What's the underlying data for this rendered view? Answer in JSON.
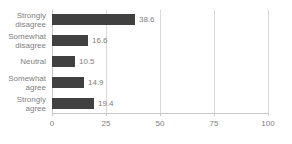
{
  "chart_data": {
    "type": "bar",
    "orientation": "horizontal",
    "title": "",
    "xlabel": "",
    "ylabel": "",
    "xlim": [
      0,
      100
    ],
    "xticks": [
      0,
      25,
      50,
      75,
      100
    ],
    "xtick_labels": [
      "0",
      "25",
      "50",
      "75",
      "100"
    ],
    "grid": true,
    "legend": false,
    "bar_color": "#404040",
    "text_color": "#808080",
    "gridline_color": "#d9d9d9",
    "background": "#ffffff",
    "categories": [
      "Strongly disagree",
      "Somewhat disagree",
      "Neutral",
      "Somewhat agree",
      "Strongly agree"
    ],
    "values": [
      38.6,
      16.6,
      10.5,
      14.9,
      19.4
    ],
    "value_labels": [
      "38.6",
      "16.6",
      "10.5",
      "14.9",
      "19.4"
    ],
    "bars": [
      {
        "category": "Strongly disagree",
        "value": 38.6,
        "label": "38.6"
      },
      {
        "category": "Somewhat disagree",
        "value": 16.6,
        "label": "16.6"
      },
      {
        "category": "Neutral",
        "value": 10.5,
        "label": "10.5"
      },
      {
        "category": "Somewhat agree",
        "value": 14.9,
        "label": "14.9"
      },
      {
        "category": "Strongly agree",
        "value": 19.4,
        "label": "19.4"
      }
    ]
  }
}
